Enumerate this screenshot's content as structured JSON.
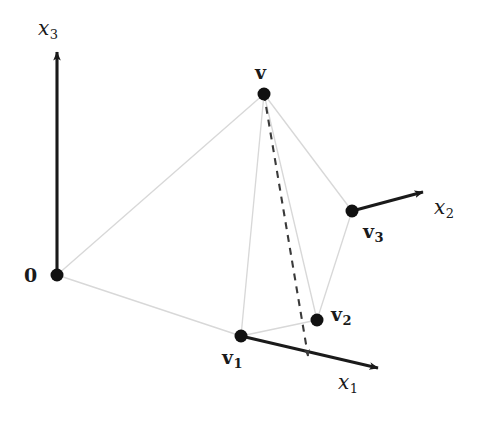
{
  "figure": {
    "kind": "vector-simplex-diagram",
    "width": 486,
    "height": 428,
    "background_color": "#ffffff",
    "ink_color": "#1a1a1a",
    "faint_edge_color": "#d8d8d8",
    "dashed_color": "#3a3a3a"
  },
  "axes": [
    {
      "id": "x1",
      "base": "x",
      "subscript": "1",
      "label": "x",
      "label_x": 338,
      "label_y": 372,
      "from": [
        241,
        336
      ],
      "to": [
        378,
        368
      ],
      "style": "solid-thick-arrow"
    },
    {
      "id": "x2",
      "base": "x",
      "subscript": "2",
      "label": "x",
      "label_x": 434,
      "label_y": 197,
      "from": [
        352,
        211
      ],
      "to": [
        423,
        192
      ],
      "style": "solid-thick-arrow"
    },
    {
      "id": "x3",
      "base": "x",
      "subscript": "3",
      "label": "x",
      "label_x": 38,
      "label_y": 18,
      "from": [
        57,
        275
      ],
      "to": [
        57,
        52
      ],
      "style": "solid-thick-arrow"
    }
  ],
  "points": [
    {
      "id": "origin",
      "label": "0",
      "subscript": "",
      "x": 57,
      "y": 275,
      "radius": 6.5,
      "label_x": 24,
      "label_y": 266
    },
    {
      "id": "v",
      "label": "v",
      "subscript": "",
      "x": 264,
      "y": 94,
      "radius": 6.5,
      "label_x": 255,
      "label_y": 63
    },
    {
      "id": "v1",
      "label": "v",
      "subscript": "1",
      "x": 241,
      "y": 336,
      "radius": 6.5,
      "label_x": 222,
      "label_y": 348
    },
    {
      "id": "v2",
      "label": "v",
      "subscript": "2",
      "x": 317,
      "y": 320,
      "radius": 6.5,
      "label_x": 331,
      "label_y": 305
    },
    {
      "id": "v3",
      "label": "v",
      "subscript": "3",
      "x": 352,
      "y": 211,
      "radius": 6.5,
      "label_x": 363,
      "label_y": 222
    }
  ],
  "faint_edges": [
    {
      "id": "origin-to-v",
      "from": [
        57,
        275
      ],
      "to": [
        264,
        94
      ]
    },
    {
      "id": "origin-to-v1",
      "from": [
        57,
        275
      ],
      "to": [
        241,
        336
      ]
    },
    {
      "id": "v-to-v1",
      "from": [
        264,
        94
      ],
      "to": [
        241,
        336
      ]
    },
    {
      "id": "v-to-v2",
      "from": [
        264,
        94
      ],
      "to": [
        317,
        320
      ]
    },
    {
      "id": "v-to-v3",
      "from": [
        264,
        94
      ],
      "to": [
        352,
        211
      ]
    },
    {
      "id": "v1-to-v2",
      "from": [
        241,
        336
      ],
      "to": [
        317,
        320
      ]
    },
    {
      "id": "v2-to-v3",
      "from": [
        317,
        320
      ],
      "to": [
        352,
        211
      ]
    }
  ],
  "dashed_edges": [
    {
      "id": "v-projection-to-x1",
      "from": [
        264,
        94
      ],
      "to": [
        308,
        356
      ],
      "style": "dashed-arrow",
      "meaning": "projection of v onto x1 axis"
    }
  ]
}
